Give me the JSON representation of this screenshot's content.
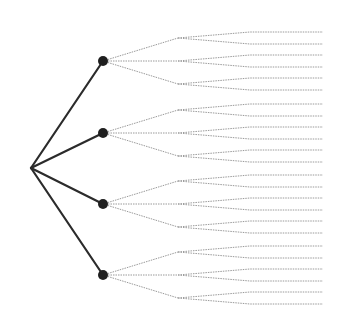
{
  "diagram": {
    "type": "tree",
    "orientation": "left-to-right",
    "colors": {
      "strong_edge": "#2b2b2b",
      "weak_edge": "#9a9a9a",
      "node": "#1f1f1f",
      "background": "#ffffff"
    },
    "root": {
      "x": 31,
      "y": 168
    },
    "level1": {
      "x": 103,
      "node_radius": 5,
      "ys": [
        61,
        133,
        204,
        275
      ]
    },
    "level2": {
      "x": 178,
      "offsets": [
        -23,
        0,
        23
      ]
    },
    "level3": {
      "bend_x": 250,
      "end_x": 323,
      "offsets": [
        -6,
        6
      ]
    }
  }
}
